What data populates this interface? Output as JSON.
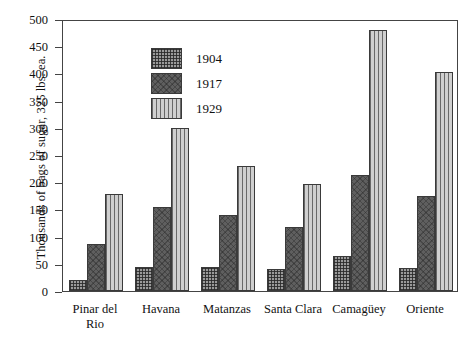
{
  "chart_data": {
    "type": "bar",
    "title": "",
    "xlabel": "",
    "ylabel": "Thousands of bags of sugar, 325 lbs. ea.",
    "ylim": [
      0,
      500
    ],
    "ytick_step": 50,
    "yticks": [
      0,
      50,
      100,
      150,
      200,
      250,
      300,
      350,
      400,
      450,
      500
    ],
    "ytick_labels": [
      "0",
      "50",
      "100",
      "150",
      "200",
      "250",
      "300",
      "350",
      "400",
      "450",
      "500"
    ],
    "grid": false,
    "legend_position": "upper-left-inside",
    "categories": [
      "Pinar del Rio",
      "Havana",
      "Matanzas",
      "Santa Clara",
      "Camagüey",
      "Oriente"
    ],
    "category_lines": [
      [
        "Pinar del",
        "Rio"
      ],
      [
        "Havana"
      ],
      [
        "Matanzas"
      ],
      [
        "Santa Clara"
      ],
      [
        "Camagüey"
      ],
      [
        "Oriente"
      ]
    ],
    "series": [
      {
        "name": "1904",
        "pattern": "crosshatch-grid",
        "color": "#9a9a9a",
        "values": [
          20,
          45,
          45,
          40,
          64,
          42
        ]
      },
      {
        "name": "1917",
        "pattern": "dark-diagonal-crosshatch",
        "color": "#5f5f5f",
        "values": [
          87,
          155,
          140,
          118,
          213,
          175
        ]
      },
      {
        "name": "1929",
        "pattern": "vertical-lines",
        "color": "#cfcfcf",
        "values": [
          178,
          299,
          230,
          197,
          480,
          403
        ]
      }
    ]
  },
  "legend": {
    "entries": [
      {
        "label": "1904"
      },
      {
        "label": "1917"
      },
      {
        "label": "1929"
      }
    ]
  }
}
